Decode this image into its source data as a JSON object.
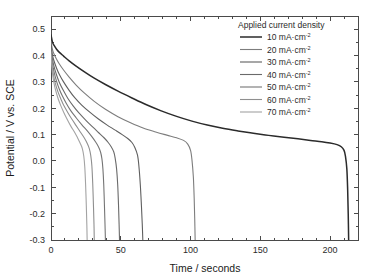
{
  "chart_data": {
    "type": "line",
    "title": "",
    "xlabel": "Time / seconds",
    "ylabel": "Potential / V vs. SCE",
    "xlim": [
      0,
      220
    ],
    "ylim": [
      -0.3,
      0.55
    ],
    "xticks": [
      0,
      50,
      100,
      150,
      200
    ],
    "xticklabels": [
      "0",
      "50",
      "100",
      "150",
      "200"
    ],
    "yticks": [
      -0.3,
      -0.2,
      -0.1,
      0.0,
      0.1,
      0.2,
      0.3,
      0.4,
      0.5
    ],
    "yticklabels": [
      "-0.3",
      "-0.2",
      "-0.1",
      "0.0",
      "0.1",
      "0.2",
      "0.3",
      "0.4",
      "0.5"
    ],
    "xminor_step": 10,
    "yminor_step": 0.05,
    "grid": false,
    "legend_title": "Applied current density",
    "legend_position": "top-right-inside",
    "frame": true,
    "series": [
      {
        "name": "10 mA·cm",
        "unit_exponent": "-2",
        "value": 10,
        "color": "#2b2b2b",
        "width": 1.5,
        "points": [
          [
            0,
            0.478
          ],
          [
            1,
            0.452
          ],
          [
            2,
            0.44
          ],
          [
            4,
            0.424
          ],
          [
            6,
            0.412
          ],
          [
            9,
            0.398
          ],
          [
            13,
            0.38
          ],
          [
            18,
            0.36
          ],
          [
            24,
            0.338
          ],
          [
            31,
            0.314
          ],
          [
            39,
            0.29
          ],
          [
            48,
            0.265
          ],
          [
            58,
            0.239
          ],
          [
            68,
            0.214
          ],
          [
            79,
            0.19
          ],
          [
            90,
            0.169
          ],
          [
            101,
            0.151
          ],
          [
            112,
            0.136
          ],
          [
            123,
            0.124
          ],
          [
            134,
            0.114
          ],
          [
            145,
            0.105
          ],
          [
            156,
            0.097
          ],
          [
            167,
            0.09
          ],
          [
            177,
            0.084
          ],
          [
            186,
            0.078
          ],
          [
            194,
            0.073
          ],
          [
            200,
            0.068
          ],
          [
            205,
            0.062
          ],
          [
            208,
            0.054
          ],
          [
            210,
            0.04
          ],
          [
            211,
            0.018
          ],
          [
            212,
            -0.03
          ],
          [
            212.6,
            -0.11
          ],
          [
            213,
            -0.2
          ],
          [
            213.3,
            -0.3
          ]
        ]
      },
      {
        "name": "20 mA·cm",
        "unit_exponent": "-2",
        "value": 20,
        "color": "#7d7d7d",
        "width": 1.1,
        "points": [
          [
            0,
            0.455
          ],
          [
            1,
            0.424
          ],
          [
            2,
            0.408
          ],
          [
            4,
            0.386
          ],
          [
            6,
            0.368
          ],
          [
            9,
            0.345
          ],
          [
            13,
            0.318
          ],
          [
            18,
            0.288
          ],
          [
            24,
            0.257
          ],
          [
            31,
            0.226
          ],
          [
            39,
            0.196
          ],
          [
            48,
            0.168
          ],
          [
            57,
            0.145
          ],
          [
            66,
            0.125
          ],
          [
            75,
            0.11
          ],
          [
            83,
            0.098
          ],
          [
            90,
            0.088
          ],
          [
            95,
            0.078
          ],
          [
            98,
            0.064
          ],
          [
            100,
            0.04
          ],
          [
            101,
            0.005
          ],
          [
            102,
            -0.06
          ],
          [
            102.6,
            -0.14
          ],
          [
            103,
            -0.22
          ],
          [
            103.3,
            -0.3
          ]
        ]
      },
      {
        "name": "30 mA·cm",
        "unit_exponent": "-2",
        "value": 30,
        "color": "#5f5f5f",
        "width": 1.1,
        "points": [
          [
            0,
            0.442
          ],
          [
            1,
            0.404
          ],
          [
            2,
            0.382
          ],
          [
            4,
            0.352
          ],
          [
            6,
            0.328
          ],
          [
            9,
            0.3
          ],
          [
            13,
            0.268
          ],
          [
            17,
            0.24
          ],
          [
            22,
            0.212
          ],
          [
            28,
            0.184
          ],
          [
            34,
            0.159
          ],
          [
            40,
            0.137
          ],
          [
            46,
            0.117
          ],
          [
            51,
            0.1
          ],
          [
            55,
            0.085
          ],
          [
            58,
            0.07
          ],
          [
            60,
            0.052
          ],
          [
            62,
            0.022
          ],
          [
            63,
            -0.02
          ],
          [
            64,
            -0.09
          ],
          [
            64.8,
            -0.17
          ],
          [
            65.4,
            -0.24
          ],
          [
            65.8,
            -0.3
          ]
        ]
      },
      {
        "name": "40 mA·cm",
        "unit_exponent": "-2",
        "value": 40,
        "color": "#6a6a6a",
        "width": 1.1,
        "points": [
          [
            0,
            0.432
          ],
          [
            1,
            0.388
          ],
          [
            2,
            0.362
          ],
          [
            4,
            0.326
          ],
          [
            6,
            0.298
          ],
          [
            9,
            0.266
          ],
          [
            12,
            0.238
          ],
          [
            16,
            0.208
          ],
          [
            20,
            0.182
          ],
          [
            25,
            0.154
          ],
          [
            30,
            0.128
          ],
          [
            34,
            0.108
          ],
          [
            38,
            0.088
          ],
          [
            41,
            0.07
          ],
          [
            43,
            0.055
          ],
          [
            45,
            0.034
          ],
          [
            46,
            0.01
          ],
          [
            47,
            -0.03
          ],
          [
            47.8,
            -0.09
          ],
          [
            48.4,
            -0.17
          ],
          [
            48.8,
            -0.24
          ],
          [
            49.1,
            -0.3
          ]
        ]
      },
      {
        "name": "50 mA·cm",
        "unit_exponent": "-2",
        "value": 50,
        "color": "#757575",
        "width": 1.1,
        "points": [
          [
            0,
            0.424
          ],
          [
            1,
            0.372
          ],
          [
            2,
            0.342
          ],
          [
            4,
            0.302
          ],
          [
            6,
            0.272
          ],
          [
            8,
            0.248
          ],
          [
            11,
            0.218
          ],
          [
            14,
            0.192
          ],
          [
            18,
            0.164
          ],
          [
            22,
            0.138
          ],
          [
            26,
            0.114
          ],
          [
            29,
            0.094
          ],
          [
            32,
            0.072
          ],
          [
            34,
            0.054
          ],
          [
            35.5,
            0.034
          ],
          [
            36.5,
            0.008
          ],
          [
            37.2,
            -0.03
          ],
          [
            37.8,
            -0.09
          ],
          [
            38.3,
            -0.17
          ],
          [
            38.7,
            -0.24
          ],
          [
            39,
            -0.3
          ]
        ]
      },
      {
        "name": "60 mA·cm",
        "unit_exponent": "-2",
        "value": 60,
        "color": "#8f8f8f",
        "width": 1.1,
        "points": [
          [
            0,
            0.414
          ],
          [
            1,
            0.354
          ],
          [
            2,
            0.32
          ],
          [
            3,
            0.296
          ],
          [
            5,
            0.262
          ],
          [
            7,
            0.236
          ],
          [
            9,
            0.212
          ],
          [
            12,
            0.184
          ],
          [
            15,
            0.158
          ],
          [
            18,
            0.134
          ],
          [
            21,
            0.11
          ],
          [
            24,
            0.086
          ],
          [
            26,
            0.066
          ],
          [
            27.5,
            0.046
          ],
          [
            28.5,
            0.02
          ],
          [
            29.3,
            -0.02
          ],
          [
            29.9,
            -0.085
          ],
          [
            30.4,
            -0.165
          ],
          [
            30.8,
            -0.24
          ],
          [
            31,
            -0.3
          ]
        ]
      },
      {
        "name": "70 mA·cm",
        "unit_exponent": "-2",
        "value": 70,
        "color": "#a3a3a3",
        "width": 1.1,
        "points": [
          [
            0,
            0.404
          ],
          [
            1,
            0.336
          ],
          [
            2,
            0.3
          ],
          [
            3,
            0.274
          ],
          [
            5,
            0.238
          ],
          [
            7,
            0.21
          ],
          [
            9,
            0.186
          ],
          [
            11,
            0.164
          ],
          [
            14,
            0.134
          ],
          [
            17,
            0.108
          ],
          [
            19,
            0.088
          ],
          [
            21,
            0.066
          ],
          [
            22.5,
            0.046
          ],
          [
            23.5,
            0.018
          ],
          [
            24.2,
            -0.022
          ],
          [
            24.8,
            -0.09
          ],
          [
            25.3,
            -0.17
          ],
          [
            25.7,
            -0.245
          ],
          [
            25.9,
            -0.3
          ]
        ]
      }
    ]
  },
  "colors": {
    "axis": "#4a4a4a",
    "text": "#2b2b2b",
    "background": "#ffffff"
  }
}
